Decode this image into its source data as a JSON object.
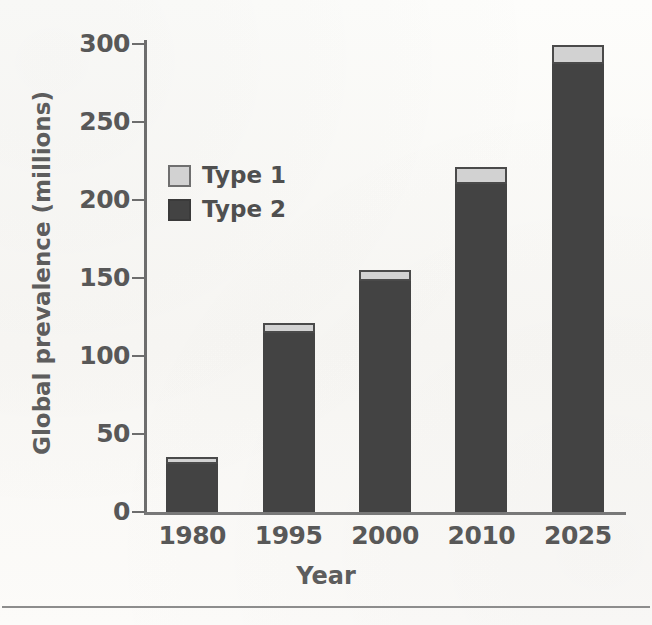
{
  "figure": {
    "background_color": "#fbfaf8",
    "has_bottom_rule": true
  },
  "chart_data": {
    "type": "bar",
    "subtype": "stacked-bar",
    "title": "",
    "xlabel": "Year",
    "ylabel": "Global prevalence (millions)",
    "categories": [
      "1980",
      "1995",
      "2000",
      "2010",
      "2025"
    ],
    "series": [
      {
        "name": "Type 1",
        "color": "#d2d2d2",
        "values": [
          3,
          5,
          6,
          10,
          11
        ]
      },
      {
        "name": "Type 2",
        "color": "#434343",
        "values": [
          31,
          115,
          148,
          210,
          287
        ]
      }
    ],
    "totals": [
      34,
      120,
      154,
      220,
      298
    ],
    "ylim": [
      0,
      300
    ],
    "yticks": [
      0,
      50,
      100,
      150,
      200,
      250,
      300
    ],
    "ytick_labels": [
      "0",
      "50",
      "100",
      "150",
      "200",
      "250",
      "300"
    ],
    "grid": false,
    "legend_position": "upper left inside",
    "legend_entries": [
      "Type 1",
      "Type 2"
    ],
    "stack_order": "Type 2 bottom, Type 1 top"
  },
  "axes": {
    "y_title": "Global prevalence (millions)",
    "x_title": "Year"
  },
  "legend": {
    "items": [
      {
        "label": "Type 1",
        "swatch": "legend-swatch-type-1"
      },
      {
        "label": "Type 2",
        "swatch": "legend-swatch-type-2"
      }
    ]
  }
}
